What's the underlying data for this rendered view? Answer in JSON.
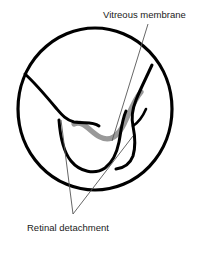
{
  "figure": {
    "labels": {
      "vitreous_membrane": "Vitreous membrane",
      "retinal_detachment": "Retinal detachment"
    },
    "colors": {
      "outline": "#000000",
      "vitreous_membrane": "#999999",
      "leader_line": "#555555",
      "background": "#ffffff",
      "text": "#1a1a1a"
    },
    "parts": [
      {
        "name": "sclera-outline",
        "shape": "circle",
        "cx": 95,
        "cy": 109,
        "rx": 77,
        "ry": 81
      },
      {
        "name": "detached-retina-upper-left",
        "shape": "curve"
      },
      {
        "name": "detached-retina-fold",
        "shape": "curve"
      },
      {
        "name": "detached-retina-right",
        "shape": "curve"
      },
      {
        "name": "vitreous-membrane-band",
        "shape": "thick-gray-curve"
      }
    ],
    "leaders": [
      {
        "name": "vitreous-leader",
        "from": [
          148,
          24
        ],
        "to": [
          112,
          141
        ]
      },
      {
        "name": "retinal-leader-left",
        "from": [
          73,
          214
        ],
        "to": [
          61,
          120
        ]
      },
      {
        "name": "retinal-leader-right",
        "from": [
          73,
          214
        ],
        "to": [
          133,
          136
        ]
      }
    ]
  }
}
